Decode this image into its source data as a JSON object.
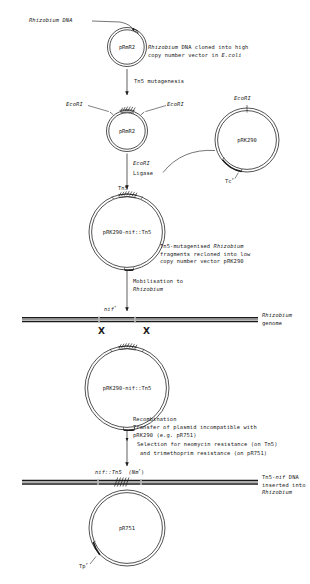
{
  "figure": {
    "title_partial": "",
    "type": "molecular-cloning-flow-diagram",
    "colors": {
      "ink": "#1a1a1a",
      "paper": "#ffffff"
    }
  },
  "steps": [
    {
      "id": "source",
      "callout": "Rhizobium DNA",
      "plasmid": "pRmR2",
      "note_lines": [
        "Rhizobium DNA cloned into high",
        "copy number vector in E.coli"
      ]
    },
    {
      "id": "mutagenesis",
      "arrow_label": "Tn5 mutagenesis",
      "plasmid": "pRmR2",
      "site_left": "EcoRI",
      "site_right": "EcoRI",
      "insert": "Tn5"
    },
    {
      "id": "vector",
      "plasmid": "pRK290",
      "site_top": "EcoRI",
      "marker": "Tc",
      "marker_sup": "r"
    },
    {
      "id": "ligation",
      "arrow_label_lines": [
        "EcoRI",
        "Ligase"
      ],
      "insert_label": "Tn5",
      "plasmid": "pRK290-nif::Tn5",
      "note_lines": [
        "Tn5-mutagenised Rhizobium",
        "fragments recloned into low",
        "copy number vector pRK290"
      ]
    },
    {
      "id": "mobilisation",
      "arrow_label_lines": [
        "Mobilisation to",
        "Rhizobium"
      ],
      "genome_label": "nif",
      "genome_label_sup": "+",
      "genome_note_lines": [
        "Rhizobium",
        "genome"
      ],
      "crossover_marks": [
        "X",
        "X"
      ],
      "plasmid": "pRK290-nif::Tn5"
    },
    {
      "id": "recombination",
      "arrow_label_lines": [
        "Recombination",
        "Transfer of plasmid incompatible with",
        "pRK290 (e.g. pR751)",
        "Selection for neomycin resistance (on Tn5)",
        "and trimethoprim resistance (on pR751)"
      ],
      "genome_label": "nif::Tn5  (Nm",
      "genome_label_sup": "r",
      "genome_label_tail": ")",
      "genome_note_lines": [
        "Tn5-nif DNA",
        "inserted into",
        "Rhizobium"
      ],
      "plasmid": "pR751",
      "marker": "Tp",
      "marker_sup": "r"
    }
  ]
}
